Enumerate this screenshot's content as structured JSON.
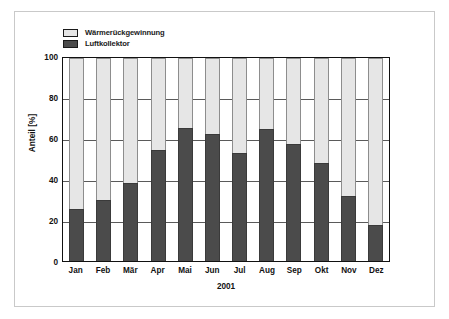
{
  "chart_data": {
    "type": "bar",
    "subtype": "stacked-bar-100-percent",
    "title": "",
    "xlabel": "2001",
    "ylabel": "Anteil [%]",
    "ylim": [
      0,
      100
    ],
    "yticks": [
      100,
      80,
      60,
      40,
      20,
      0
    ],
    "ytick_labels": [
      "100",
      "80",
      "60",
      "40",
      "20",
      "0"
    ],
    "grid": true,
    "grid_axis": "y",
    "legend_position": "top-left-inside",
    "categories": [
      "Jan",
      "Feb",
      "Mär",
      "Apr",
      "Mai",
      "Jun",
      "Jul",
      "Aug",
      "Sep",
      "Okt",
      "Nov",
      "Dez"
    ],
    "series": [
      {
        "name": "Luftkollektor",
        "color": "#4b4b4b",
        "values": [
          25.5,
          30.0,
          38.5,
          54.5,
          65.5,
          62.5,
          53.0,
          65.0,
          57.5,
          48.5,
          32.0,
          17.5
        ]
      },
      {
        "name": "Wärmerückgewinnung",
        "color": "#e6e6e6",
        "values": [
          74.5,
          70.0,
          61.5,
          45.5,
          34.5,
          37.5,
          47.0,
          35.0,
          42.5,
          51.5,
          68.0,
          82.5
        ]
      }
    ]
  },
  "legend": {
    "items": [
      {
        "label": "Wärmerückgewinnung",
        "color": "#e6e6e6"
      },
      {
        "label": "Luftkollektor",
        "color": "#4b4b4b"
      }
    ]
  },
  "axes": {
    "y_title": "Anteil [%]",
    "x_title": "2001",
    "y_ticks": [
      "100",
      "80",
      "60",
      "40",
      "20",
      "0"
    ],
    "x_ticks": [
      "Jan",
      "Feb",
      "Mär",
      "Apr",
      "Mai",
      "Jun",
      "Jul",
      "Aug",
      "Sep",
      "Okt",
      "Nov",
      "Dez"
    ]
  }
}
